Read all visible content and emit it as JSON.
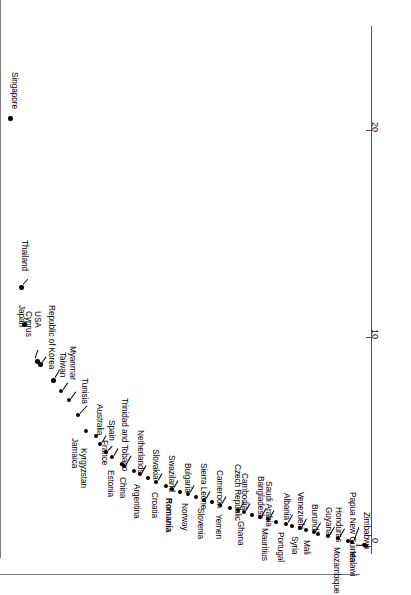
{
  "chart_data": {
    "type": "scatter",
    "title": "",
    "xlabel": "",
    "ylabel": "",
    "orientation": "rotated-90",
    "grid": false,
    "legend": null,
    "axis": {
      "ticks": [
        0,
        10,
        20
      ],
      "tick_labels": [
        "0",
        "10",
        "20"
      ],
      "range": [
        0,
        25.4
      ]
    },
    "categories": [
      "Singapore",
      "Thailand",
      "Cyprus",
      "Japan",
      "USA",
      "Republic of Korea",
      "Taiwan",
      "Myanmar",
      "Tunisia",
      "Jamaica",
      "Kyrgyzstan",
      "France",
      "Australia",
      "Spain",
      "Estonia",
      "Trinidad and Tobago",
      "China",
      "Netherlands",
      "Argentina",
      "Slovakia",
      "Croatia",
      "Swaziland",
      "Romania",
      "Bulgaria",
      "Norway",
      "Sierra Leone",
      "Slovenia",
      "Cameroon",
      "Yemen",
      "Czech Republic",
      "Cambodia",
      "Ghana",
      "Bangladesh",
      "Saudi Arabia",
      "Mauritius",
      "Albania",
      "Portugal",
      "Venezuela",
      "Syria",
      "Burundi",
      "Mali",
      "Guyana",
      "Honduras",
      "Mozambique",
      "Papua New Guinea",
      "Malawi",
      "Zimbabwe"
    ],
    "values": [
      20.6,
      12.4,
      10.6,
      8.9,
      8.7,
      8.6,
      7.6,
      7.2,
      6.4,
      5.5,
      5.2,
      4.3,
      4.2,
      3.8,
      3.2,
      3.1,
      2.8,
      2.7,
      2.4,
      2.3,
      2.1,
      2.0,
      1.9,
      1.85,
      1.75,
      1.7,
      1.6,
      1.55,
      1.45,
      1.4,
      1.3,
      1.2,
      1.1,
      1.05,
      0.95,
      0.9,
      0.8,
      0.75,
      0.7,
      0.62,
      0.58,
      0.5,
      0.42,
      0.3,
      0.25,
      0.12,
      0.08
    ],
    "highlighted": [
      "Romania"
    ]
  },
  "points": [
    {
      "name": "Singapore",
      "x": 10,
      "y": 118,
      "lx": 20,
      "ly": 72,
      "lead": null,
      "bold": false
    },
    {
      "name": "Thailand",
      "x": 21,
      "y": 287,
      "lx": 30,
      "ly": 240,
      "lead": {
        "x": 23,
        "y": 284,
        "len": 7,
        "ang": -48
      },
      "bold": false
    },
    {
      "name": "Cyprus",
      "x": 24,
      "y": 324,
      "lx": 34,
      "ly": 311,
      "lead": null,
      "bold": false
    },
    {
      "name": "Japan",
      "x": 37,
      "y": 361,
      "lx": 27,
      "ly": 305,
      "lead": {
        "x": 35,
        "y": 358,
        "len": 9,
        "ang": -72
      },
      "bold": false
    },
    {
      "name": "USA",
      "x": 40,
      "y": 364,
      "lx": 43,
      "ly": 311,
      "lead": {
        "x": 42,
        "y": 362,
        "len": 7,
        "ang": -55
      },
      "bold": false
    },
    {
      "name": "Republic of Korea",
      "x": 53,
      "y": 380,
      "lx": 57,
      "ly": 305,
      "lead": {
        "x": 55,
        "y": 377,
        "len": 9,
        "ang": -60
      },
      "bold": false
    },
    {
      "name": "Taiwan",
      "x": 61,
      "y": 391,
      "lx": 68,
      "ly": 352,
      "lead": {
        "x": 63,
        "y": 389,
        "len": 8,
        "ang": -55
      },
      "bold": false
    },
    {
      "name": "Myanmar",
      "x": 69,
      "y": 400,
      "lx": 78,
      "ly": 346,
      "lead": {
        "x": 71,
        "y": 398,
        "len": 8,
        "ang": -55
      },
      "bold": false
    },
    {
      "name": "Tunisia",
      "x": 78,
      "y": 415,
      "lx": 90,
      "ly": 378,
      "lead": {
        "x": 80,
        "y": 413,
        "len": 10,
        "ang": -48
      },
      "bold": false
    },
    {
      "name": "Jamaica",
      "x": 86,
      "y": 431,
      "lx": 80,
      "ly": 438,
      "lead": null,
      "bold": false
    },
    {
      "name": "Kyrgyzstan",
      "x": 96,
      "y": 436,
      "lx": 89,
      "ly": 448,
      "lead": null,
      "bold": false
    },
    {
      "name": "France",
      "x": 106,
      "y": 452,
      "lx": 110,
      "ly": 440,
      "lead": {
        "x": 108,
        "y": 450,
        "len": 6,
        "ang": -45
      },
      "bold": false
    },
    {
      "name": "Australia",
      "x": 100,
      "y": 444,
      "lx": 105,
      "ly": 404,
      "lead": {
        "x": 102,
        "y": 442,
        "len": 8,
        "ang": -60
      },
      "bold": false
    },
    {
      "name": "Spain",
      "x": 112,
      "y": 457,
      "lx": 117,
      "ly": 420,
      "lead": {
        "x": 114,
        "y": 455,
        "len": 8,
        "ang": -60
      },
      "bold": false
    },
    {
      "name": "Estonia",
      "x": 122,
      "y": 464,
      "lx": 116,
      "ly": 470,
      "lead": null,
      "bold": false
    },
    {
      "name": "Trinidad and Tobago",
      "x": 124,
      "y": 466,
      "lx": 130,
      "ly": 398,
      "lead": {
        "x": 126,
        "y": 464,
        "len": 10,
        "ang": -60
      },
      "bold": false
    },
    {
      "name": "China",
      "x": 134,
      "y": 471,
      "lx": 128,
      "ly": 477,
      "lead": null,
      "bold": false
    },
    {
      "name": "Netherlands",
      "x": 140,
      "y": 474,
      "lx": 146,
      "ly": 430,
      "lead": {
        "x": 142,
        "y": 472,
        "len": 8,
        "ang": -60
      },
      "bold": false
    },
    {
      "name": "Argentina",
      "x": 148,
      "y": 478,
      "lx": 142,
      "ly": 484,
      "lead": null,
      "bold": false
    },
    {
      "name": "Slovakia",
      "x": 156,
      "y": 482,
      "lx": 161,
      "ly": 449,
      "lead": {
        "x": 158,
        "y": 480,
        "len": 8,
        "ang": -60
      },
      "bold": false
    },
    {
      "name": "Croatia",
      "x": 166,
      "y": 486,
      "lx": 160,
      "ly": 492,
      "lead": null,
      "bold": false
    },
    {
      "name": "Swaziland",
      "x": 172,
      "y": 489,
      "lx": 177,
      "ly": 455,
      "lead": {
        "x": 174,
        "y": 487,
        "len": 8,
        "ang": -60
      },
      "bold": false
    },
    {
      "name": "Romania",
      "x": 180,
      "y": 492,
      "lx": 174,
      "ly": 498,
      "lead": null,
      "bold": true
    },
    {
      "name": "Bulgaria",
      "x": 188,
      "y": 494,
      "lx": 193,
      "ly": 463,
      "lead": {
        "x": 190,
        "y": 492,
        "len": 8,
        "ang": -60
      },
      "bold": false
    },
    {
      "name": "Norway",
      "x": 196,
      "y": 497,
      "lx": 190,
      "ly": 503,
      "lead": null,
      "bold": false
    },
    {
      "name": "Sierra Leone",
      "x": 204,
      "y": 500,
      "lx": 209,
      "ly": 463,
      "lead": {
        "x": 206,
        "y": 498,
        "len": 8,
        "ang": -60
      },
      "bold": false
    },
    {
      "name": "Slovenia",
      "x": 212,
      "y": 502,
      "lx": 206,
      "ly": 508,
      "lead": null,
      "bold": false
    },
    {
      "name": "Cameroon",
      "x": 220,
      "y": 505,
      "lx": 225,
      "ly": 470,
      "lead": {
        "x": 222,
        "y": 503,
        "len": 8,
        "ang": -60
      },
      "bold": false
    },
    {
      "name": "Yemen",
      "x": 230,
      "y": 508,
      "lx": 224,
      "ly": 514,
      "lead": null,
      "bold": false
    },
    {
      "name": "Czech Republic",
      "x": 238,
      "y": 510,
      "lx": 243,
      "ly": 464,
      "lead": {
        "x": 240,
        "y": 508,
        "len": 8,
        "ang": -60
      },
      "bold": false
    },
    {
      "name": "Cambodia",
      "x": 244,
      "y": 512,
      "lx": 250,
      "ly": 473,
      "lead": {
        "x": 246,
        "y": 510,
        "len": 8,
        "ang": -60
      },
      "bold": false
    },
    {
      "name": "Ghana",
      "x": 252,
      "y": 515,
      "lx": 246,
      "ly": 521,
      "lead": null,
      "bold": false
    },
    {
      "name": "Bangladesh",
      "x": 260,
      "y": 517,
      "lx": 266,
      "ly": 476,
      "lead": {
        "x": 262,
        "y": 515,
        "len": 8,
        "ang": -60
      },
      "bold": false
    },
    {
      "name": "Saudi Arabia",
      "x": 268,
      "y": 519,
      "lx": 274,
      "ly": 481,
      "lead": {
        "x": 270,
        "y": 517,
        "len": 8,
        "ang": -60
      },
      "bold": false
    },
    {
      "name": "Mauritius",
      "x": 276,
      "y": 522,
      "lx": 270,
      "ly": 528,
      "lead": null,
      "bold": false
    },
    {
      "name": "Albania",
      "x": 286,
      "y": 524,
      "lx": 292,
      "ly": 493,
      "lead": {
        "x": 288,
        "y": 522,
        "len": 9,
        "ang": -60
      },
      "bold": false
    },
    {
      "name": "Portugal",
      "x": 292,
      "y": 526,
      "lx": 286,
      "ly": 532,
      "lead": null,
      "bold": false
    },
    {
      "name": "Venezuela",
      "x": 300,
      "y": 528,
      "lx": 306,
      "ly": 492,
      "lead": {
        "x": 302,
        "y": 526,
        "len": 9,
        "ang": -60
      },
      "bold": false
    },
    {
      "name": "Syria",
      "x": 306,
      "y": 530,
      "lx": 300,
      "ly": 536,
      "lead": null,
      "bold": false
    },
    {
      "name": "Burundi",
      "x": 314,
      "y": 532,
      "lx": 320,
      "ly": 504,
      "lead": {
        "x": 316,
        "y": 530,
        "len": 9,
        "ang": -60
      },
      "bold": false
    },
    {
      "name": "Mali",
      "x": 318,
      "y": 534,
      "lx": 312,
      "ly": 540,
      "lead": null,
      "bold": false
    },
    {
      "name": "Guyana",
      "x": 328,
      "y": 536,
      "lx": 334,
      "ly": 507,
      "lead": {
        "x": 330,
        "y": 534,
        "len": 9,
        "ang": -60
      },
      "bold": false
    },
    {
      "name": "Honduras",
      "x": 338,
      "y": 538,
      "lx": 344,
      "ly": 507,
      "lead": {
        "x": 340,
        "y": 536,
        "len": 9,
        "ang": -60
      },
      "bold": false
    },
    {
      "name": "Mozambique",
      "x": 348,
      "y": 541,
      "lx": 342,
      "ly": 547,
      "lead": null,
      "bold": false
    },
    {
      "name": "Papua New Guinea",
      "x": 352,
      "y": 542,
      "lx": 358,
      "ly": 492,
      "lead": {
        "x": 354,
        "y": 540,
        "len": 14,
        "ang": -70
      },
      "bold": false
    },
    {
      "name": "Malawi",
      "x": 364,
      "y": 545,
      "lx": 358,
      "ly": 551,
      "lead": {
        "x": 362,
        "y": 545,
        "len": 6,
        "ang": 180
      },
      "bold": false
    },
    {
      "name": "Zimbabwe",
      "x": 366,
      "y": 546,
      "lx": 372,
      "ly": 512,
      "lead": null,
      "bold": false
    }
  ],
  "axis": {
    "ticks": [
      {
        "label": "20",
        "y": 130
      },
      {
        "label": "10",
        "y": 337
      },
      {
        "label": "0",
        "y": 546
      }
    ]
  }
}
